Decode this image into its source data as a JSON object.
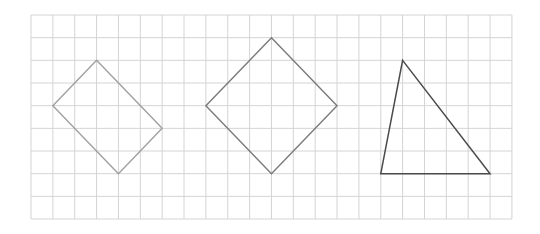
{
  "grid": {
    "origin_x": 31,
    "origin_y": 15,
    "cols": 22,
    "rows": 9,
    "cell_w": 21.86,
    "cell_h": 22.67,
    "line_color": "#d4d4d4"
  },
  "shapes": [
    {
      "name": "rectangle",
      "type": "polygon",
      "points": [
        [
          3,
          2
        ],
        [
          6,
          5
        ],
        [
          4,
          7
        ],
        [
          1,
          4
        ]
      ],
      "stroke": "#a0a0a0",
      "stroke_width": 1.4
    },
    {
      "name": "square",
      "type": "polygon",
      "points": [
        [
          11,
          1
        ],
        [
          14,
          4
        ],
        [
          11,
          7
        ],
        [
          8,
          4
        ]
      ],
      "stroke": "#7a7a7a",
      "stroke_width": 1.4
    },
    {
      "name": "triangle",
      "type": "polygon",
      "points": [
        [
          17,
          2
        ],
        [
          21,
          7
        ],
        [
          16,
          7
        ]
      ],
      "stroke": "#4a4a4a",
      "stroke_width": 1.5
    }
  ]
}
